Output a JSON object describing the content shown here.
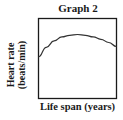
{
  "chart_data": {
    "type": "line",
    "title": "Graph 2",
    "xlabel": "Life span (years)",
    "ylabel": "Heart rate (beats/min)",
    "ylabel_lines": [
      "Heart rate",
      "(beats/min)"
    ],
    "x_ticks": [],
    "y_ticks": [],
    "grid": false,
    "legend": null,
    "series": [
      {
        "name": "Heart rate",
        "shape": "rises then gently falls (inverted-U)",
        "x": [
          0,
          0.1,
          0.2,
          0.3,
          0.4,
          0.5,
          0.6,
          0.7,
          0.8,
          0.9,
          1.0
        ],
        "y": [
          0.52,
          0.64,
          0.72,
          0.77,
          0.79,
          0.8,
          0.79,
          0.77,
          0.74,
          0.7,
          0.65
        ]
      }
    ],
    "xlim": [
      0,
      1
    ],
    "ylim": [
      0,
      1
    ],
    "note": "No numeric axis values shown; values are relative (0-1)"
  }
}
